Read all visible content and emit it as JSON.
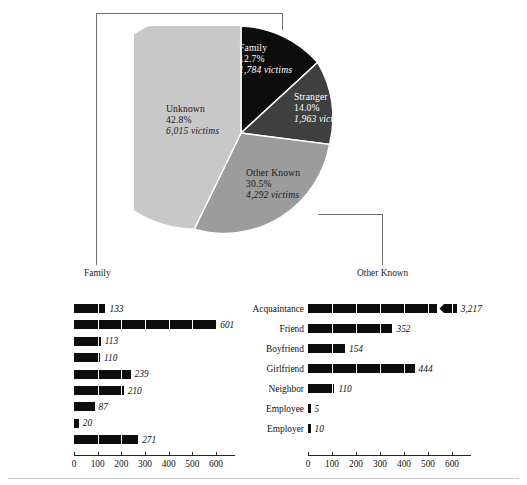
{
  "chart_data": [
    {
      "type": "pie",
      "title": "",
      "legend": "none",
      "categories": [
        "Family",
        "Stranger",
        "Other Known",
        "Unknown"
      ],
      "values": [
        1784,
        1963,
        4292,
        6015
      ],
      "percents": [
        12.7,
        14.0,
        30.5,
        42.8
      ],
      "slices": [
        {
          "name": "Family",
          "pct_label": "12.7%",
          "value_label": "1,784 victims",
          "value": 1784,
          "percent": 12.7,
          "color": "#0d0d0d",
          "text_color": "#ffffff"
        },
        {
          "name": "Stranger",
          "pct_label": "14.0%",
          "value_label": "1,963 victims",
          "value": 1963,
          "percent": 14.0,
          "color": "#3f3f3f",
          "text_color": "#ffffff"
        },
        {
          "name": "Other Known",
          "pct_label": "30.5%",
          "value_label": "4,292 victims",
          "value": 4292,
          "percent": 30.5,
          "color": "#9c9c9c",
          "text_color": "#1a1a1a"
        },
        {
          "name": "Unknown",
          "pct_label": "42.8%",
          "value_label": "6,015 victims",
          "value": 6015,
          "percent": 42.8,
          "color": "#c8c8c8",
          "text_color": "#1a1a1a"
        }
      ]
    },
    {
      "type": "bar",
      "orientation": "horizontal",
      "title": "Family",
      "xlabel": "",
      "ylabel": "",
      "xlim": [
        0,
        600
      ],
      "ticks": [
        "0",
        "100",
        "200",
        "300",
        "400",
        "500",
        "600"
      ],
      "grid": false,
      "categories": [
        "Husband",
        "Wife",
        "Mother",
        "Father",
        "Son",
        "Daughter",
        "Brother",
        "Sister",
        "Other Family"
      ],
      "values": [
        133,
        601,
        113,
        110,
        239,
        210,
        87,
        20,
        271
      ],
      "value_labels": [
        "133",
        "601",
        "113",
        "110",
        "239",
        "210",
        "87",
        "20",
        "271"
      ]
    },
    {
      "type": "bar",
      "orientation": "horizontal",
      "title": "Other Known",
      "xlabel": "",
      "ylabel": "",
      "xlim": [
        0,
        600
      ],
      "ticks": [
        "0",
        "100",
        "200",
        "300",
        "400",
        "500",
        "600"
      ],
      "grid": false,
      "categories": [
        "Acquaintance",
        "Friend",
        "Boyfriend",
        "Girlfriend",
        "Neighbor",
        "Employee",
        "Employer"
      ],
      "values": [
        3217,
        352,
        154,
        444,
        110,
        5,
        10
      ],
      "value_labels": [
        "3,217",
        "352",
        "154",
        "444",
        "110",
        "5",
        "10"
      ],
      "axis_break": {
        "category": "Acquaintance",
        "note": "bar truncated with zigzag break"
      }
    }
  ],
  "pie": {
    "slices": [
      {
        "name": "Family",
        "pct": "12.7%",
        "victims": "1,784 victims"
      },
      {
        "name": "Stranger",
        "pct": "14.0%",
        "victims": "1,963 victims"
      },
      {
        "name": "Other Known",
        "pct": "30.5%",
        "victims": "4,292 victims"
      },
      {
        "name": "Unknown",
        "pct": "42.8%",
        "victims": "6,015 victims"
      }
    ]
  },
  "connectors": {
    "left_label": "Family",
    "right_label": "Other Known"
  },
  "family_chart": {
    "rows": [
      {
        "label": "Husband",
        "value": 133,
        "value_label": "133"
      },
      {
        "label": "Wife",
        "value": 601,
        "value_label": "601"
      },
      {
        "label": "Mother",
        "value": 113,
        "value_label": "113"
      },
      {
        "label": "Father",
        "value": 110,
        "value_label": "110"
      },
      {
        "label": "Son",
        "value": 239,
        "value_label": "239"
      },
      {
        "label": "Daughter",
        "value": 210,
        "value_label": "210"
      },
      {
        "label": "Brother",
        "value": 87,
        "value_label": "87"
      },
      {
        "label": "Sister",
        "value": 20,
        "value_label": "20"
      },
      {
        "label": "Other Family",
        "value": 271,
        "value_label": "271"
      }
    ],
    "ticks": [
      "0",
      "100",
      "200",
      "300",
      "400",
      "500",
      "600"
    ]
  },
  "other_known_chart": {
    "rows": [
      {
        "label": "Acquaintance",
        "value": 3217,
        "value_label": "3,217",
        "broken": true
      },
      {
        "label": "Friend",
        "value": 352,
        "value_label": "352",
        "broken": false
      },
      {
        "label": "Boyfriend",
        "value": 154,
        "value_label": "154",
        "broken": false
      },
      {
        "label": "Girlfriend",
        "value": 444,
        "value_label": "444",
        "broken": false
      },
      {
        "label": "Neighbor",
        "value": 110,
        "value_label": "110",
        "broken": false
      },
      {
        "label": "Employee",
        "value": 5,
        "value_label": "5",
        "broken": false
      },
      {
        "label": "Employer",
        "value": 10,
        "value_label": "10",
        "broken": false
      }
    ],
    "ticks": [
      "0",
      "100",
      "200",
      "300",
      "400",
      "500",
      "600"
    ]
  },
  "colors": {
    "family": "#0d0d0d",
    "stranger": "#3f3f3f",
    "other_known": "#9c9c9c",
    "unknown": "#c8c8c8",
    "bar": "#0d0d0d",
    "leader": "#6d6d6d"
  }
}
